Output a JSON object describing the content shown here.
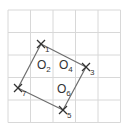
{
  "diagram": {
    "colors": {
      "grid": "#d8d8d8",
      "edge": "#6e6e6e",
      "marker": "#333333",
      "text": "#333333"
    },
    "grid": {
      "x_lines": [
        8,
        30.5,
        53,
        75.5,
        98,
        120.5
      ],
      "y_lines": [
        10,
        32.5,
        55,
        77.5,
        100,
        122.5
      ]
    },
    "x_markers": [
      {
        "id": "X1",
        "symbol": "X",
        "sub": "1",
        "x": 41,
        "y": 44
      },
      {
        "id": "X3",
        "symbol": "X",
        "sub": "3",
        "x": 86,
        "y": 67
      },
      {
        "id": "X5",
        "symbol": "X",
        "sub": "5",
        "x": 63,
        "y": 110
      },
      {
        "id": "X7",
        "symbol": "X",
        "sub": "7",
        "x": 18,
        "y": 88
      }
    ],
    "o_labels": [
      {
        "id": "O2",
        "symbol": "O",
        "sub": "2",
        "x": 37,
        "y": 69
      },
      {
        "id": "O4",
        "symbol": "O",
        "sub": "4",
        "x": 59,
        "y": 69
      },
      {
        "id": "O6",
        "symbol": "O",
        "sub": "6",
        "x": 57,
        "y": 93
      }
    ],
    "polygon_order": [
      "X1",
      "X3",
      "X5",
      "X7"
    ]
  }
}
